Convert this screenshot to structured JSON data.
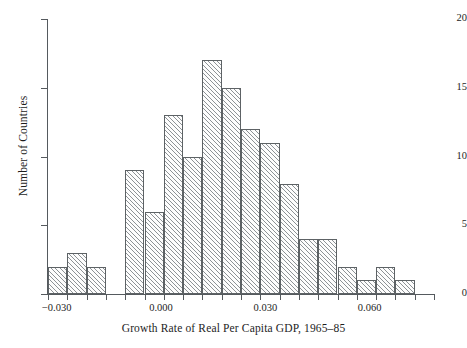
{
  "chart_data": {
    "type": "bar",
    "title": "",
    "subtitle": "",
    "xlabel": "Growth Rate of Real Per Capita GDP, 1965–85",
    "ylabel": "Number of Countries",
    "xlim": [
      -0.0325,
      0.0785
    ],
    "ylim": [
      0,
      20
    ],
    "grid": false,
    "legend": null,
    "bin_width": 0.00555,
    "x_tick_labels": [
      "-0.030",
      "0.000",
      "0.030",
      "0.060"
    ],
    "x_tick_values": [
      -0.03,
      0.0,
      0.03,
      0.06
    ],
    "y_tick_labels": [
      "0",
      "5",
      "10",
      "15",
      "20"
    ],
    "y_tick_values": [
      0,
      5,
      10,
      15,
      20
    ],
    "categories": [
      "-0.0325 to -0.0270",
      "-0.0270 to -0.0214",
      "-0.0214 to -0.0159",
      "-0.0159 to -0.0103",
      "-0.0103 to -0.0048",
      "-0.0048 to 0.0008",
      "0.0008 to 0.0063",
      "0.0063 to 0.0119",
      "0.0119 to 0.0174",
      "0.0174 to 0.0230",
      "0.0230 to 0.0285",
      "0.0285 to 0.0341",
      "0.0341 to 0.0396",
      "0.0396 to 0.0452",
      "0.0452 to 0.0507",
      "0.0507 to 0.0563",
      "0.0563 to 0.0618",
      "0.0618 to 0.0674",
      "0.0674 to 0.0729",
      "0.0729 to 0.0785"
    ],
    "values": [
      2,
      3,
      2,
      0,
      9,
      6,
      13,
      10,
      17,
      15,
      12,
      11,
      8,
      4,
      4,
      2,
      1,
      2,
      1,
      0
    ],
    "colors": {
      "bar_edge": "#5d6265",
      "bar_hatch": "#8d9296",
      "bar_fill": "#fdfdfd",
      "axis": "#555a5e",
      "text": "#1d1d1d",
      "background": "#ffffff"
    }
  }
}
